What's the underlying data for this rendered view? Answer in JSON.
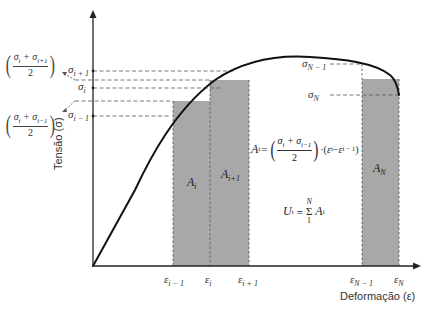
{
  "axes": {
    "y_label": "Tensão (σ)",
    "x_label": "Deformação (ε)"
  },
  "y_ticks": [
    {
      "id": "sigma_i_plus_1",
      "base": "σ",
      "sub": "i + 1"
    },
    {
      "id": "sigma_i",
      "base": "σ",
      "sub": "i"
    },
    {
      "id": "sigma_i_minus_1",
      "base": "σ",
      "sub": "i − 1"
    },
    {
      "id": "sigma_N_minus_1",
      "base": "σ",
      "sub": "N − 1"
    },
    {
      "id": "sigma_N",
      "base": "σ",
      "sub": "N"
    }
  ],
  "x_ticks": [
    {
      "id": "eps_i_minus_1",
      "base": "ε",
      "sub": "i − 1"
    },
    {
      "id": "eps_i",
      "base": "ε",
      "sub": "i"
    },
    {
      "id": "eps_i_plus_1",
      "base": "ε",
      "sub": "i + 1"
    },
    {
      "id": "eps_N_minus_1",
      "base": "ε",
      "sub": "N − 1"
    },
    {
      "id": "eps_N",
      "base": "ε",
      "sub": "N"
    }
  ],
  "midpoint_labels": {
    "upper": {
      "num_a": "σ",
      "num_a_sub": "i",
      "op": " + ",
      "num_b": "σ",
      "num_b_sub": "i+1",
      "den": "2"
    },
    "lower": {
      "num_a": "σ",
      "num_a_sub": "i",
      "op": " + ",
      "num_b": "σ",
      "num_b_sub": "i−1",
      "den": "2"
    }
  },
  "areas": [
    {
      "id": "A_i",
      "base": "A",
      "sub": "i"
    },
    {
      "id": "A_i_plus_1",
      "base": "A",
      "sub": "i+1"
    },
    {
      "id": "A_N",
      "base": "A",
      "sub": "N"
    }
  ],
  "formulas": {
    "area": {
      "lhs": "A",
      "lhs_sub": "i",
      "eq": "=",
      "num": "σ",
      "num_sub_a": "i",
      "plus": " + ",
      "num_b": "σ",
      "num_sub_b": "i−1",
      "den": "2",
      "dot": "·",
      "eps_a": "ε",
      "eps_a_sub": "i",
      "minus": " − ",
      "eps_b": "ε",
      "eps_b_sub": "i − 1"
    },
    "energy": {
      "lhs": "U",
      "lhs_sub": "t",
      "eq": "=",
      "sum": "Σ",
      "upper": "N",
      "lower": "1",
      "term": "A",
      "term_sub": "i"
    }
  },
  "colors": {
    "bar_fill": "#a8a8a8",
    "curve": "#111111",
    "axis": "#222222",
    "dash": "#555555"
  }
}
